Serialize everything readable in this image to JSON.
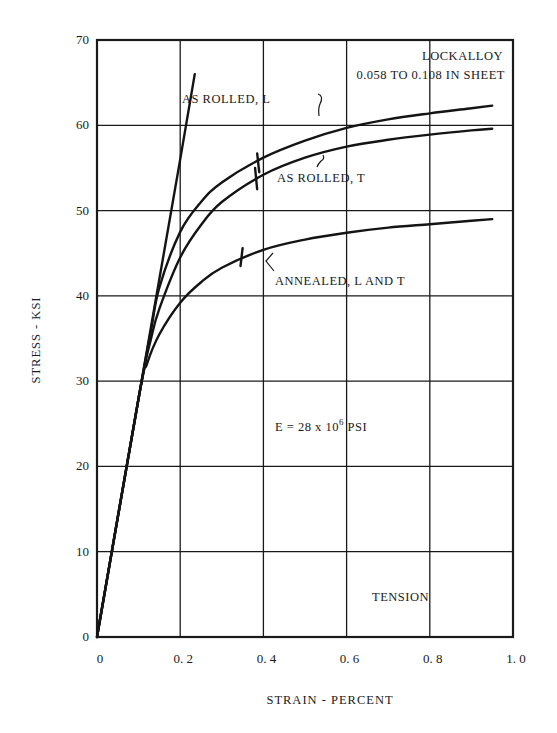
{
  "chart_data": {
    "type": "line",
    "title": "LOCKALLOY",
    "subtitle": "0.058 TO 0.108 IN SHEET",
    "xlabel": "STRAIN - PERCENT",
    "ylabel": "STRESS - KSI",
    "xlim": [
      0,
      1.0
    ],
    "ylim": [
      0,
      70
    ],
    "x_ticks": [
      "0",
      "0.2",
      "0.4",
      "0.6",
      "0.8",
      "1.0"
    ],
    "y_ticks": [
      "0",
      "10",
      "20",
      "30",
      "40",
      "50",
      "60",
      "70"
    ],
    "grid": true,
    "legend_position": "none (inline labels)",
    "annotations": [
      {
        "text": "E = 28 x 10^6 PSI",
        "x": 0.55,
        "y": 24
      },
      {
        "text": "TENSION",
        "x": 0.73,
        "y": 4.5
      },
      {
        "text": "AS ROLLED, L",
        "x": 0.2,
        "y": 62
      },
      {
        "text": "AS ROLLED, T",
        "x": 0.42,
        "y": 54
      },
      {
        "text": "ANNEALED, L AND T",
        "x": 0.42,
        "y": 41
      }
    ],
    "series": [
      {
        "name": "Modulus line (E = 28 x 10^6 PSI)",
        "x": [
          0,
          0.05,
          0.1,
          0.15,
          0.2,
          0.235
        ],
        "y": [
          0,
          14,
          28,
          42,
          56,
          66
        ]
      },
      {
        "name": "AS ROLLED, L",
        "x": [
          0,
          0.1,
          0.13,
          0.15,
          0.2,
          0.25,
          0.3,
          0.4,
          0.5,
          0.6,
          0.7,
          0.8,
          0.9,
          0.95
        ],
        "y": [
          0,
          28,
          36,
          41,
          47.5,
          51,
          53.3,
          56.2,
          58.2,
          59.7,
          60.7,
          61.4,
          62.0,
          62.3
        ]
      },
      {
        "name": "AS ROLLED, T",
        "x": [
          0,
          0.1,
          0.13,
          0.15,
          0.2,
          0.25,
          0.3,
          0.4,
          0.5,
          0.6,
          0.7,
          0.8,
          0.9,
          0.95
        ],
        "y": [
          0,
          28,
          35,
          38.5,
          44.5,
          48.3,
          51,
          54.2,
          56.2,
          57.5,
          58.3,
          58.9,
          59.4,
          59.6
        ]
      },
      {
        "name": "ANNEALED, L AND T",
        "x": [
          0,
          0.1,
          0.12,
          0.15,
          0.2,
          0.25,
          0.3,
          0.4,
          0.5,
          0.6,
          0.7,
          0.8,
          0.9,
          0.95
        ],
        "y": [
          0,
          28,
          32,
          35.5,
          39.2,
          41.6,
          43.3,
          45.4,
          46.6,
          47.4,
          48.0,
          48.4,
          48.8,
          49.0
        ]
      }
    ]
  }
}
